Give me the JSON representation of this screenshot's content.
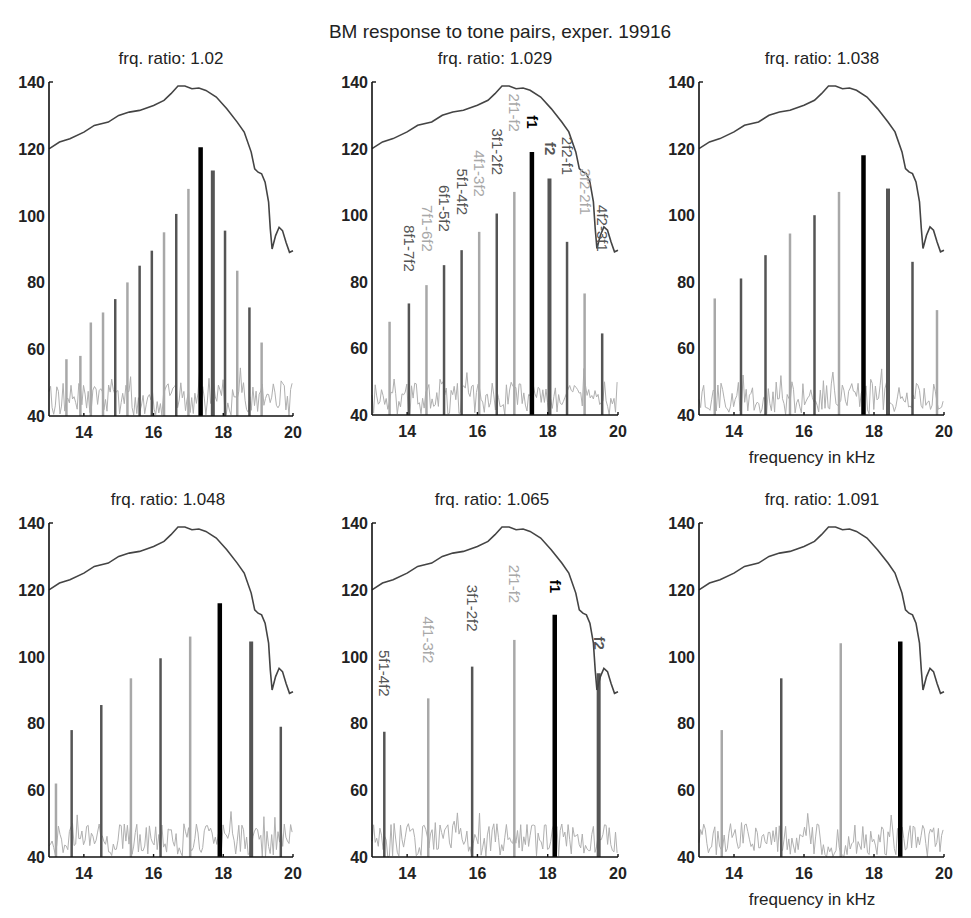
{
  "figure": {
    "title": "BM response to tone pairs, exper. 19916",
    "xlabel": "frequency in kHz",
    "colors": {
      "envelope": "#444444",
      "f1": "#000000",
      "f2": "#555555",
      "dark_dp": "#555555",
      "light_dp": "#a8a8a8",
      "noise": "#b0b0b0",
      "axis": "#111111"
    }
  },
  "chart_data": [
    {
      "type": "bar",
      "title": "frq. ratio: 1.02",
      "xlabel": "",
      "ylabel": "",
      "xlim": [
        13,
        20
      ],
      "ylim": [
        40,
        140
      ],
      "xticks": [
        14,
        16,
        18,
        20
      ],
      "yticks": [
        40,
        60,
        80,
        100,
        120,
        140
      ],
      "envelope": {
        "x": [
          13,
          13.3,
          13.6,
          14,
          14.3,
          14.7,
          15,
          15.3,
          15.6,
          16,
          16.3,
          16.5,
          16.7,
          16.9,
          17.1,
          17.3,
          17.5,
          17.8,
          18.1,
          18.4,
          18.6,
          18.8,
          18.9,
          19.0,
          19.1,
          19.2,
          19.3,
          19.35,
          19.4,
          19.5,
          19.6,
          19.7,
          19.8,
          19.9,
          20
        ],
        "y": [
          120,
          122,
          123,
          125,
          127,
          128,
          130,
          131,
          131.5,
          133,
          134.5,
          136.5,
          138.8,
          138.8,
          138,
          138.2,
          137.5,
          135.5,
          132,
          128,
          125,
          119,
          114,
          113,
          112.5,
          110,
          104,
          96,
          90,
          94,
          96.5,
          95.5,
          92,
          89,
          89.5
        ]
      },
      "bars": [
        {
          "f": 13.5,
          "level": 57,
          "shade": "light"
        },
        {
          "f": 13.9,
          "level": 58,
          "shade": "light"
        },
        {
          "f": 14.2,
          "level": 68,
          "shade": "light"
        },
        {
          "f": 14.55,
          "level": 71,
          "shade": "light"
        },
        {
          "f": 14.9,
          "level": 75,
          "shade": "dark"
        },
        {
          "f": 15.25,
          "level": 80,
          "shade": "light"
        },
        {
          "f": 15.6,
          "level": 85,
          "shade": "dark"
        },
        {
          "f": 15.95,
          "level": 89.5,
          "shade": "dark"
        },
        {
          "f": 16.3,
          "level": 95,
          "shade": "light"
        },
        {
          "f": 16.65,
          "level": 100.5,
          "shade": "dark"
        },
        {
          "f": 17.0,
          "level": 108,
          "shade": "light"
        },
        {
          "f": 17.35,
          "level": 120.5,
          "shade": "f1",
          "name": "f1"
        },
        {
          "f": 17.7,
          "level": 113.5,
          "shade": "f2",
          "name": "f2"
        },
        {
          "f": 18.05,
          "level": 95.5,
          "shade": "dark"
        },
        {
          "f": 18.4,
          "level": 83.5,
          "shade": "light"
        },
        {
          "f": 18.75,
          "level": 72.5,
          "shade": "dark"
        },
        {
          "f": 19.1,
          "level": 62,
          "shade": "light"
        }
      ],
      "annotations": []
    },
    {
      "type": "bar",
      "title": "frq. ratio: 1.029",
      "xlabel": "",
      "ylabel": "",
      "xlim": [
        13,
        20
      ],
      "ylim": [
        40,
        140
      ],
      "xticks": [
        14,
        16,
        18,
        20
      ],
      "yticks": [
        40,
        60,
        80,
        100,
        120,
        140
      ],
      "envelope": {
        "x": [
          13,
          13.3,
          13.6,
          14,
          14.3,
          14.7,
          15,
          15.3,
          15.6,
          16,
          16.3,
          16.5,
          16.7,
          16.9,
          17.1,
          17.3,
          17.5,
          17.8,
          18.1,
          18.4,
          18.6,
          18.8,
          18.9,
          19.0,
          19.1,
          19.2,
          19.3,
          19.35,
          19.4,
          19.5,
          19.6,
          19.7,
          19.8,
          19.9,
          20
        ],
        "y": [
          120,
          122,
          123,
          125,
          127,
          128,
          130,
          131,
          131.5,
          133,
          134.5,
          136.5,
          138.8,
          138.8,
          138,
          138.2,
          137.5,
          135.5,
          132,
          128,
          125,
          119,
          114,
          113,
          112.5,
          110,
          104,
          96,
          90,
          94,
          96.5,
          95.5,
          92,
          89,
          89.5
        ]
      },
      "bars": [
        {
          "f": 13.5,
          "level": 68,
          "shade": "light"
        },
        {
          "f": 14.05,
          "level": 73.5,
          "shade": "dark",
          "name": "8f1-7f2"
        },
        {
          "f": 14.55,
          "level": 79,
          "shade": "light",
          "name": "7f1-6f2"
        },
        {
          "f": 15.05,
          "level": 85,
          "shade": "dark",
          "name": "6f1-5f2"
        },
        {
          "f": 15.55,
          "level": 89.5,
          "shade": "dark",
          "name": "5f1-4f2"
        },
        {
          "f": 16.05,
          "level": 95,
          "shade": "light",
          "name": "4f1-3f2"
        },
        {
          "f": 16.55,
          "level": 100.5,
          "shade": "dark",
          "name": "3f1-2f2"
        },
        {
          "f": 17.05,
          "level": 107,
          "shade": "light",
          "name": "2f1-f2"
        },
        {
          "f": 17.55,
          "level": 119,
          "shade": "f1",
          "name": "f1"
        },
        {
          "f": 18.05,
          "level": 111,
          "shade": "f2",
          "name": "f2"
        },
        {
          "f": 18.55,
          "level": 92,
          "shade": "dark",
          "name": "2f2-f1"
        },
        {
          "f": 19.05,
          "level": 76.5,
          "shade": "light",
          "name": "3f2-2f1"
        },
        {
          "f": 19.55,
          "level": 64.5,
          "shade": "dark",
          "name": "4f2-3f1"
        }
      ],
      "annotations": [
        {
          "text": "8f1-7f2",
          "f": 14.05,
          "level": 83,
          "shade": "dark"
        },
        {
          "text": "7f1-6f2",
          "f": 14.55,
          "level": 89,
          "shade": "light"
        },
        {
          "text": "6f1-5f2",
          "f": 15.05,
          "level": 95,
          "shade": "dark"
        },
        {
          "text": "5f1-4f2",
          "f": 15.55,
          "level": 100,
          "shade": "dark"
        },
        {
          "text": "4f1-3f2",
          "f": 16.05,
          "level": 105.5,
          "shade": "light"
        },
        {
          "text": "3f1-2f2",
          "f": 16.55,
          "level": 112,
          "shade": "dark"
        },
        {
          "text": "2f1-f2",
          "f": 17.05,
          "level": 125,
          "shade": "light"
        },
        {
          "text": "f1",
          "f": 17.55,
          "level": 126,
          "shade": "f1"
        },
        {
          "text": "f2",
          "f": 18.05,
          "level": 118,
          "shade": "f2"
        },
        {
          "text": "2f2-f1",
          "f": 18.55,
          "level": 112,
          "shade": "dark"
        },
        {
          "text": "3f2-2f1",
          "f": 19.05,
          "level": 100,
          "shade": "light"
        },
        {
          "text": "4f2-3f1",
          "f": 19.55,
          "level": 89,
          "shade": "dark"
        }
      ]
    },
    {
      "type": "bar",
      "title": "frq. ratio: 1.038",
      "xlabel": "frequency in kHz",
      "ylabel": "",
      "xlim": [
        13,
        20
      ],
      "ylim": [
        40,
        140
      ],
      "xticks": [
        14,
        16,
        18,
        20
      ],
      "yticks": [
        40,
        60,
        80,
        100,
        120,
        140
      ],
      "envelope": {
        "x": [
          13,
          13.3,
          13.6,
          14,
          14.3,
          14.7,
          15,
          15.3,
          15.6,
          16,
          16.3,
          16.5,
          16.7,
          16.9,
          17.1,
          17.3,
          17.5,
          17.8,
          18.1,
          18.4,
          18.6,
          18.8,
          18.9,
          19.0,
          19.1,
          19.2,
          19.3,
          19.35,
          19.4,
          19.5,
          19.6,
          19.7,
          19.8,
          19.9,
          20
        ],
        "y": [
          120,
          122,
          123,
          125,
          127,
          128,
          130,
          131,
          131.5,
          133,
          134.5,
          136.5,
          138.8,
          138.8,
          138,
          138.2,
          137.5,
          135.5,
          132,
          128,
          125,
          119,
          114,
          113,
          112.5,
          110,
          104,
          96,
          90,
          94,
          96.5,
          95.5,
          92,
          89,
          89.5
        ]
      },
      "bars": [
        {
          "f": 13.45,
          "level": 75,
          "shade": "light"
        },
        {
          "f": 14.2,
          "level": 81,
          "shade": "dark"
        },
        {
          "f": 14.9,
          "level": 88,
          "shade": "dark"
        },
        {
          "f": 15.6,
          "level": 94.5,
          "shade": "light"
        },
        {
          "f": 16.3,
          "level": 100,
          "shade": "dark"
        },
        {
          "f": 17.0,
          "level": 107,
          "shade": "light"
        },
        {
          "f": 17.7,
          "level": 118,
          "shade": "f1",
          "name": "f1"
        },
        {
          "f": 18.4,
          "level": 108,
          "shade": "f2",
          "name": "f2"
        },
        {
          "f": 19.1,
          "level": 86,
          "shade": "dark"
        },
        {
          "f": 19.8,
          "level": 71.5,
          "shade": "light"
        }
      ],
      "annotations": []
    },
    {
      "type": "bar",
      "title": "frq. ratio: 1.048",
      "xlabel": "",
      "ylabel": "",
      "xlim": [
        13,
        20
      ],
      "ylim": [
        40,
        140
      ],
      "xticks": [
        14,
        16,
        18,
        20
      ],
      "yticks": [
        40,
        60,
        80,
        100,
        120,
        140
      ],
      "envelope": {
        "x": [
          13,
          13.3,
          13.6,
          14,
          14.3,
          14.7,
          15,
          15.3,
          15.6,
          16,
          16.3,
          16.5,
          16.7,
          16.9,
          17.1,
          17.3,
          17.5,
          17.8,
          18.1,
          18.4,
          18.6,
          18.8,
          18.9,
          19.0,
          19.1,
          19.2,
          19.3,
          19.35,
          19.4,
          19.5,
          19.6,
          19.7,
          19.8,
          19.9,
          20
        ],
        "y": [
          120,
          122,
          123,
          125,
          127,
          128,
          130,
          131,
          131.5,
          133,
          134.5,
          136.5,
          138.8,
          138.8,
          138,
          138.2,
          137.5,
          135.5,
          132,
          128,
          125,
          119,
          114,
          113,
          112.5,
          110,
          104,
          96,
          90,
          94,
          96.5,
          95.5,
          92,
          89,
          89.5
        ]
      },
      "bars": [
        {
          "f": 13.2,
          "level": 62,
          "shade": "light"
        },
        {
          "f": 13.65,
          "level": 78,
          "shade": "dark"
        },
        {
          "f": 14.5,
          "level": 85.5,
          "shade": "dark"
        },
        {
          "f": 15.35,
          "level": 93.5,
          "shade": "light"
        },
        {
          "f": 16.2,
          "level": 99.5,
          "shade": "dark"
        },
        {
          "f": 17.05,
          "level": 106,
          "shade": "light"
        },
        {
          "f": 17.9,
          "level": 116,
          "shade": "f1",
          "name": "f1"
        },
        {
          "f": 18.8,
          "level": 104.5,
          "shade": "f2",
          "name": "f2"
        },
        {
          "f": 19.65,
          "level": 79,
          "shade": "dark"
        }
      ],
      "annotations": []
    },
    {
      "type": "bar",
      "title": "frq. ratio: 1.065",
      "xlabel": "",
      "ylabel": "",
      "xlim": [
        13,
        20
      ],
      "ylim": [
        40,
        140
      ],
      "xticks": [
        14,
        16,
        18,
        20
      ],
      "yticks": [
        40,
        60,
        80,
        100,
        120,
        140
      ],
      "envelope": {
        "x": [
          13,
          13.3,
          13.6,
          14,
          14.3,
          14.7,
          15,
          15.3,
          15.6,
          16,
          16.3,
          16.5,
          16.7,
          16.9,
          17.1,
          17.3,
          17.5,
          17.8,
          18.1,
          18.4,
          18.6,
          18.8,
          18.9,
          19.0,
          19.1,
          19.2,
          19.3,
          19.35,
          19.4,
          19.5,
          19.6,
          19.7,
          19.8,
          19.9,
          20
        ],
        "y": [
          120,
          122,
          123,
          125,
          127,
          128,
          130,
          131,
          131.5,
          133,
          134.5,
          136.5,
          138.8,
          138.8,
          138,
          138.2,
          137.5,
          135.5,
          132,
          128,
          125,
          119,
          114,
          113,
          112.5,
          110,
          104,
          96,
          90,
          94,
          96.5,
          95.5,
          92,
          89,
          89.5
        ]
      },
      "bars": [
        {
          "f": 13.35,
          "level": 77.5,
          "shade": "dark",
          "name": "5f1-4f2"
        },
        {
          "f": 14.6,
          "level": 87.5,
          "shade": "light",
          "name": "4f1-3f2"
        },
        {
          "f": 15.85,
          "level": 97,
          "shade": "dark",
          "name": "3f1-2f2"
        },
        {
          "f": 17.05,
          "level": 105,
          "shade": "light",
          "name": "2f1-f2"
        },
        {
          "f": 18.2,
          "level": 112.5,
          "shade": "f1",
          "name": "f1"
        },
        {
          "f": 19.45,
          "level": 95,
          "shade": "f2",
          "name": "f2"
        }
      ],
      "annotations": [
        {
          "text": "5f1-4f2",
          "f": 13.35,
          "level": 88,
          "shade": "dark"
        },
        {
          "text": "4f1-3f2",
          "f": 14.6,
          "level": 98,
          "shade": "light"
        },
        {
          "text": "3f1-2f2",
          "f": 15.85,
          "level": 107.5,
          "shade": "dark"
        },
        {
          "text": "2f1-f2",
          "f": 17.05,
          "level": 116,
          "shade": "light"
        },
        {
          "text": "f1",
          "f": 18.2,
          "level": 119,
          "shade": "f1"
        },
        {
          "text": "f2",
          "f": 19.45,
          "level": 102,
          "shade": "f2"
        }
      ]
    },
    {
      "type": "bar",
      "title": "frq. ratio: 1.091",
      "xlabel": "frequency in kHz",
      "ylabel": "",
      "xlim": [
        13,
        20
      ],
      "ylim": [
        40,
        140
      ],
      "xticks": [
        14,
        16,
        18,
        20
      ],
      "yticks": [
        40,
        60,
        80,
        100,
        120,
        140
      ],
      "envelope": {
        "x": [
          13,
          13.3,
          13.6,
          14,
          14.3,
          14.7,
          15,
          15.3,
          15.6,
          16,
          16.3,
          16.5,
          16.7,
          16.9,
          17.1,
          17.3,
          17.5,
          17.8,
          18.1,
          18.4,
          18.6,
          18.8,
          18.9,
          19.0,
          19.1,
          19.2,
          19.3,
          19.35,
          19.4,
          19.5,
          19.6,
          19.7,
          19.8,
          19.9,
          20
        ],
        "y": [
          120,
          122,
          123,
          125,
          127,
          128,
          130,
          131,
          131.5,
          133,
          134.5,
          136.5,
          138.8,
          138.8,
          138,
          138.2,
          137.5,
          135.5,
          132,
          128,
          125,
          119,
          114,
          113,
          112.5,
          110,
          104,
          96,
          90,
          94,
          96.5,
          95.5,
          92,
          89,
          89.5
        ]
      },
      "bars": [
        {
          "f": 13.65,
          "level": 78,
          "shade": "light"
        },
        {
          "f": 15.35,
          "level": 93.5,
          "shade": "dark"
        },
        {
          "f": 17.05,
          "level": 104,
          "shade": "light"
        },
        {
          "f": 18.75,
          "level": 104.5,
          "shade": "f1",
          "name": "f1"
        }
      ],
      "annotations": []
    }
  ]
}
